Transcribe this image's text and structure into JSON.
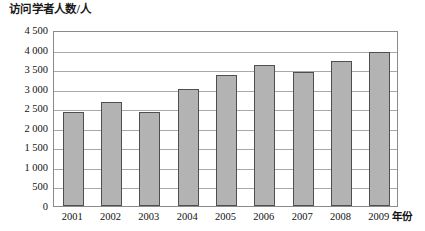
{
  "chart_data": {
    "type": "bar",
    "title": "访问学者人数/人",
    "xlabel": "年份",
    "ylabel": "访问学者人数/人",
    "categories": [
      "2001",
      "2002",
      "2003",
      "2004",
      "2005",
      "2006",
      "2007",
      "2008",
      "2009"
    ],
    "values": [
      2400,
      2650,
      2400,
      3000,
      3350,
      3600,
      3430,
      3700,
      3950
    ],
    "ylim": [
      0,
      4500
    ],
    "yticks": [
      0,
      500,
      1000,
      1500,
      2000,
      2500,
      3000,
      3500,
      4000,
      4500
    ],
    "ytick_labels": [
      "0",
      "500",
      "1 000",
      "1 500",
      "2 000",
      "2 500",
      "3 000",
      "3 500",
      "4 000",
      "4 500"
    ],
    "grid": true,
    "legend": null,
    "bar_color": "#b3b3b3",
    "bar_border_color": "#4f4f4f",
    "grid_color": "#a8a8a8",
    "axis_color": "#8a8a8a",
    "series": [
      {
        "name": "访问学者人数",
        "values": [
          2400,
          2650,
          2400,
          3000,
          3350,
          3600,
          3430,
          3700,
          3950
        ]
      }
    ]
  }
}
